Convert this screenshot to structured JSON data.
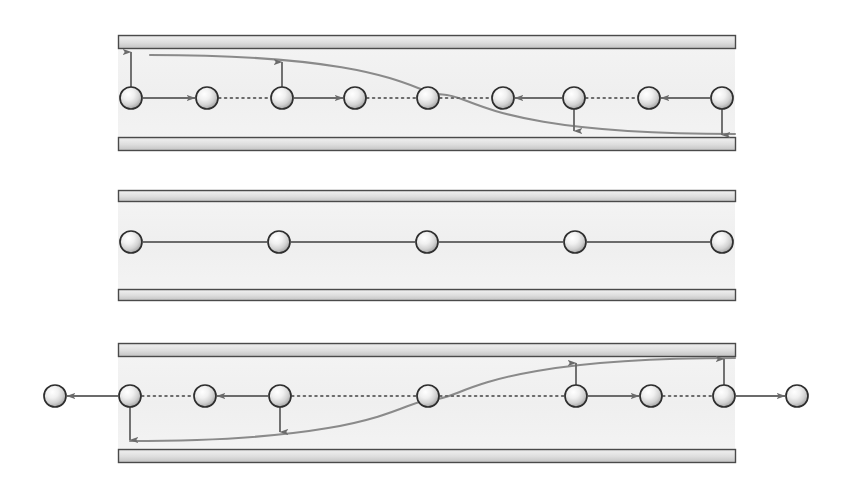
{
  "figure": {
    "type": "diagram",
    "background_color": "#ffffff",
    "panel_count": 3,
    "colors": {
      "wall_border": "#4a4a4a",
      "wall_fill_light": "#e6e6e6",
      "wall_fill_dark": "#c9c9c9",
      "channel_fill": "#f2f2f2",
      "arrow": "#6b6b6b",
      "curve": "#8a8a8a",
      "sphere_stroke": "#2e2e2e",
      "sphere_light": "#ffffff",
      "sphere_mid": "#dcdcdc",
      "sphere_dark": "#9a9a9a"
    },
    "geometry": {
      "sphere_radius": 11,
      "wall_thickness": 13,
      "panel_left": 118,
      "panel_right": 735
    },
    "panels": [
      {
        "id": "panel-top",
        "name": "upward-then-downward-deflection",
        "channel": {
          "x": 118,
          "y": 35,
          "width": 617,
          "height": 115
        },
        "top_wall": {
          "x": 118,
          "y": 35,
          "width": 617,
          "height": 13
        },
        "bottom_wall": {
          "x": 118,
          "y": 137,
          "width": 617,
          "height": 13
        },
        "particle_row_y": 98,
        "spheres_x": [
          131,
          207,
          282,
          355,
          428,
          503,
          574,
          649,
          722
        ],
        "horizontal_segments": [
          {
            "from_x": 131,
            "to_x": 207,
            "style": "solid",
            "direction": "right"
          },
          {
            "from_x": 207,
            "to_x": 282,
            "style": "dotted",
            "direction": "none"
          },
          {
            "from_x": 282,
            "to_x": 355,
            "style": "solid",
            "direction": "right"
          },
          {
            "from_x": 355,
            "to_x": 428,
            "style": "dotted",
            "direction": "none"
          },
          {
            "from_x": 428,
            "to_x": 503,
            "style": "dotted",
            "direction": "none"
          },
          {
            "from_x": 574,
            "to_x": 503,
            "style": "solid",
            "direction": "left"
          },
          {
            "from_x": 574,
            "to_x": 649,
            "style": "dotted",
            "direction": "none"
          },
          {
            "from_x": 722,
            "to_x": 649,
            "style": "solid",
            "direction": "left"
          }
        ],
        "vertical_arrows": [
          {
            "x": 131,
            "from_y": 87,
            "to_y": 52,
            "direction": "up"
          },
          {
            "x": 282,
            "from_y": 87,
            "to_y": 62,
            "direction": "up"
          },
          {
            "x": 574,
            "from_y": 109,
            "to_y": 131,
            "direction": "down"
          },
          {
            "x": 722,
            "from_y": 109,
            "to_y": 135,
            "direction": "down"
          }
        ],
        "curve": {
          "shape": "descending-sigmoid",
          "start": {
            "x": 150,
            "y": 55
          },
          "end": {
            "x": 735,
            "y": 134
          },
          "note": "starts near top wall, crosses mid-channel at centre sphere, flattens onto bottom wall"
        }
      },
      {
        "id": "panel-middle",
        "name": "straight-undeflected-path",
        "channel": {
          "x": 118,
          "y": 190,
          "width": 617,
          "height": 110
        },
        "top_wall": {
          "x": 118,
          "y": 190,
          "width": 617,
          "height": 11
        },
        "bottom_wall": {
          "x": 118,
          "y": 289,
          "width": 617,
          "height": 11
        },
        "particle_row_y": 242,
        "spheres_x": [
          131,
          279,
          427,
          575,
          722
        ],
        "horizontal_segments": [
          {
            "from_x": 131,
            "to_x": 279,
            "style": "solid",
            "direction": "none"
          },
          {
            "from_x": 279,
            "to_x": 427,
            "style": "solid",
            "direction": "none"
          },
          {
            "from_x": 427,
            "to_x": 575,
            "style": "solid",
            "direction": "none"
          },
          {
            "from_x": 575,
            "to_x": 722,
            "style": "solid",
            "direction": "none"
          }
        ],
        "vertical_arrows": [],
        "curve": null
      },
      {
        "id": "panel-bottom",
        "name": "downward-then-upward-deflection",
        "channel": {
          "x": 118,
          "y": 343,
          "width": 617,
          "height": 119
        },
        "top_wall": {
          "x": 118,
          "y": 343,
          "width": 617,
          "height": 13
        },
        "bottom_wall": {
          "x": 118,
          "y": 449,
          "width": 617,
          "height": 13
        },
        "particle_row_y": 396,
        "spheres_x": [
          55,
          130,
          205,
          280,
          428,
          576,
          651,
          724,
          797
        ],
        "horizontal_segments": [
          {
            "from_x": 130,
            "to_x": 55,
            "style": "solid",
            "direction": "left"
          },
          {
            "from_x": 130,
            "to_x": 205,
            "style": "dotted",
            "direction": "none"
          },
          {
            "from_x": 280,
            "to_x": 205,
            "style": "solid",
            "direction": "left"
          },
          {
            "from_x": 280,
            "to_x": 428,
            "style": "dotted",
            "direction": "none"
          },
          {
            "from_x": 428,
            "to_x": 576,
            "style": "dotted",
            "direction": "none"
          },
          {
            "from_x": 576,
            "to_x": 651,
            "style": "solid",
            "direction": "right"
          },
          {
            "from_x": 651,
            "to_x": 724,
            "style": "dotted",
            "direction": "none"
          },
          {
            "from_x": 724,
            "to_x": 797,
            "style": "solid",
            "direction": "right"
          }
        ],
        "vertical_arrows": [
          {
            "x": 130,
            "from_y": 407,
            "to_y": 440,
            "direction": "down"
          },
          {
            "x": 280,
            "from_y": 407,
            "to_y": 432,
            "direction": "down"
          },
          {
            "x": 576,
            "from_y": 385,
            "to_y": 363,
            "direction": "up"
          },
          {
            "x": 724,
            "from_y": 385,
            "to_y": 359,
            "direction": "up"
          }
        ],
        "curve": {
          "shape": "ascending-sigmoid",
          "start": {
            "x": 130,
            "y": 441
          },
          "end": {
            "x": 735,
            "y": 358
          },
          "note": "starts near bottom wall, crosses mid-channel at centre sphere, flattens onto top wall"
        }
      }
    ]
  }
}
